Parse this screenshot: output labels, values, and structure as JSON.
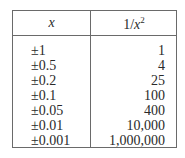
{
  "table": {
    "headers": {
      "x": "x",
      "f_base": "1/",
      "f_var": "x",
      "f_exp": "2"
    },
    "rows": [
      {
        "x": "±1",
        "value": "1"
      },
      {
        "x": "±0.5",
        "value": "4"
      },
      {
        "x": "±0.2",
        "value": "25"
      },
      {
        "x": "±0.1",
        "value": "100"
      },
      {
        "x": "±0.05",
        "value": "400"
      },
      {
        "x": "±0.01",
        "value": "10,000"
      },
      {
        "x": "±0.001",
        "value": "1,000,000"
      }
    ]
  }
}
